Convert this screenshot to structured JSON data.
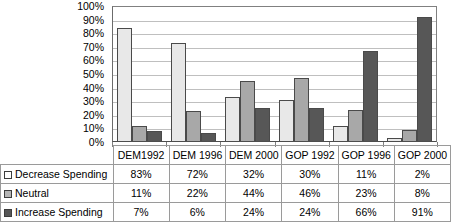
{
  "chart_data": {
    "type": "bar",
    "title": "",
    "xlabel": "",
    "ylabel": "",
    "ylim": [
      0,
      100
    ],
    "grid": true,
    "legend_position": "table-left",
    "categories": [
      "DEM1992",
      "DEM 1996",
      "DEM 2000",
      "GOP 1992",
      "GOP 1996",
      "GOP 2000"
    ],
    "ytick_labels": [
      "100%",
      "90%",
      "80%",
      "70%",
      "60%",
      "50%",
      "40%",
      "30%",
      "20%",
      "10%",
      "0%"
    ],
    "ytick_values": [
      100,
      90,
      80,
      70,
      60,
      50,
      40,
      30,
      20,
      10,
      0
    ],
    "series": [
      {
        "name": "Decrease Spending",
        "color": "#e8e8e8",
        "swatch_color": "#ffffff",
        "values": [
          83,
          72,
          32,
          30,
          11,
          2
        ],
        "labels": [
          "83%",
          "72%",
          "32%",
          "30%",
          "11%",
          "2%"
        ]
      },
      {
        "name": "Neutral",
        "color": "#a8a8a8",
        "swatch_color": "#b5b5b5",
        "values": [
          11,
          22,
          44,
          46,
          23,
          8
        ],
        "labels": [
          "11%",
          "22%",
          "44%",
          "46%",
          "23%",
          "8%"
        ]
      },
      {
        "name": "Increase Spending",
        "color": "#575757",
        "swatch_color": "#575757",
        "values": [
          7,
          6,
          24,
          24,
          66,
          91
        ],
        "labels": [
          "7%",
          "6%",
          "24%",
          "24%",
          "66%",
          "91%"
        ]
      }
    ]
  }
}
